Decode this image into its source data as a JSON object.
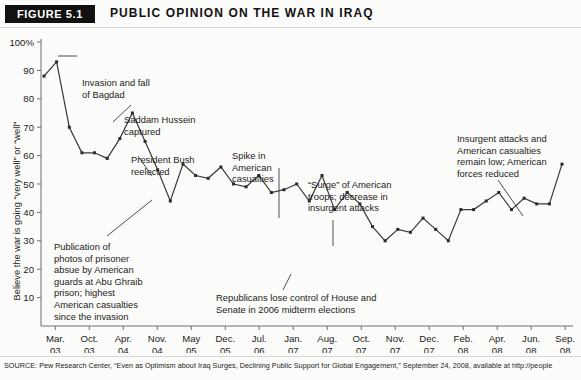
{
  "figure": {
    "badge": "FIGURE 5.1",
    "title": "PUBLIC OPINION ON THE WAR IN IRAQ"
  },
  "source": {
    "text": "SOURCE: Pew Research Center, “Even as Optimism about Iraq Surges, Declining Public Support for Global Engagement,” September 24, 2008, available at http://people"
  },
  "annotations": {
    "invasion": [
      "Invasion and fall",
      "of Bagdad"
    ],
    "saddam": [
      "Saddam Hussein",
      "captured"
    ],
    "bush": [
      "President Bush",
      "reelected"
    ],
    "spike": [
      "Spike in",
      "American",
      "casualties"
    ],
    "abu_ghraib": [
      "Publication of",
      "photos of prisoner",
      "absue by American",
      "guards at Abu Ghraib",
      "prison; highest",
      "American casualties",
      "since the invasion"
    ],
    "republicans": [
      "Republicans lose control of House and",
      "Senate in 2006 midterm elections"
    ],
    "surge": [
      "“Surge” of American",
      "troops; decrease in",
      "insurgent attacks"
    ],
    "insurgent": [
      "Insurgent attacks and",
      "American casualties",
      "remain low; American",
      "forces reduced"
    ]
  },
  "chart_data": {
    "type": "line",
    "title": "PUBLIC OPINION ON THE WAR IN IRAQ",
    "xlabel": "",
    "ylabel": "Believe the war is going “very well” or “well”",
    "ylim": [
      0,
      100
    ],
    "yticks": [
      10,
      20,
      30,
      40,
      50,
      60,
      70,
      80,
      90,
      100
    ],
    "ytick_labels": [
      "10",
      "20",
      "30",
      "40",
      "50",
      "60",
      "70",
      "80",
      "90",
      "100%"
    ],
    "grid": false,
    "legend": "none",
    "line_color": "#3a3a3a",
    "marker_color": "#2b2b2b",
    "xtick_labels": [
      {
        "month": "Mar.",
        "year": "03"
      },
      {
        "month": "Oct.",
        "year": "03"
      },
      {
        "month": "Apr.",
        "year": "04"
      },
      {
        "month": "Nov.",
        "year": "04"
      },
      {
        "month": "May",
        "year": "05"
      },
      {
        "month": "Dec.",
        "year": "05"
      },
      {
        "month": "Jul.",
        "year": "06"
      },
      {
        "month": "Jan.",
        "year": "07"
      },
      {
        "month": "Aug.",
        "year": "07"
      },
      {
        "month": "Oct.",
        "year": "07"
      },
      {
        "month": "Nov.",
        "year": "07"
      },
      {
        "month": "Dec.",
        "year": "07"
      },
      {
        "month": "Feb.",
        "year": "08"
      },
      {
        "month": "Apr.",
        "year": "08"
      },
      {
        "month": "Jun.",
        "year": "08"
      },
      {
        "month": "Sep.",
        "year": "08"
      }
    ],
    "values": [
      88,
      93,
      70,
      61,
      61,
      59,
      66,
      75,
      65,
      55,
      44,
      57,
      53,
      52,
      56,
      50,
      49,
      53,
      47,
      48,
      50,
      44,
      53,
      41,
      47,
      43,
      35,
      30,
      34,
      33,
      38,
      34,
      30,
      41,
      41,
      44,
      47,
      41,
      45,
      43,
      43,
      57
    ],
    "value_count": 42,
    "min_value": 30,
    "max_value": 93
  }
}
